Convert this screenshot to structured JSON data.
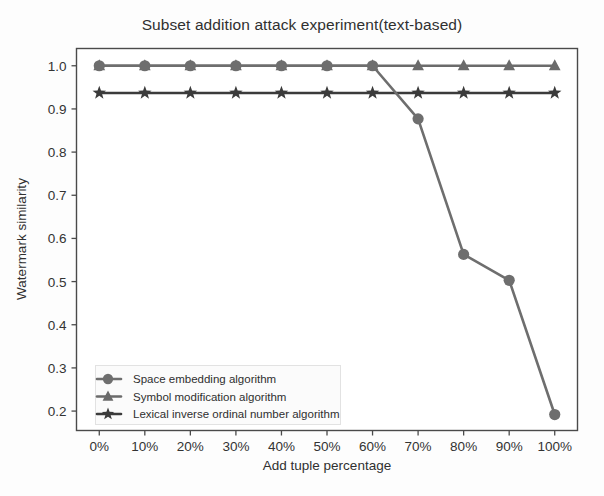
{
  "chart_data": {
    "type": "line",
    "title": "Subset addition attack experiment(text-based)",
    "xlabel": "Add tuple percentage",
    "ylabel": "Watermark similarity",
    "categories": [
      "0%",
      "10%",
      "20%",
      "30%",
      "40%",
      "50%",
      "60%",
      "70%",
      "80%",
      "90%",
      "100%"
    ],
    "x": [
      0,
      10,
      20,
      30,
      40,
      50,
      60,
      70,
      80,
      90,
      100
    ],
    "xtick_labels": [
      "0%",
      "10%",
      "20%",
      "30%",
      "40%",
      "50%",
      "60%",
      "70%",
      "80%",
      "90%",
      "100%"
    ],
    "ytick_labels": [
      "0.2",
      "0.3",
      "0.4",
      "0.5",
      "0.6",
      "0.7",
      "0.8",
      "0.9",
      "1.0"
    ],
    "yticks": [
      0.2,
      0.3,
      0.4,
      0.5,
      0.6,
      0.7,
      0.8,
      0.9,
      1.0
    ],
    "ylim": [
      0.155,
      1.04
    ],
    "xlim": [
      -5,
      105
    ],
    "grid": false,
    "legend_position": "lower left",
    "series": [
      {
        "name": "Space embedding algorithm",
        "marker": "circle",
        "color": "#6e6e6e",
        "values": [
          1.0,
          1.0,
          1.0,
          1.0,
          1.0,
          1.0,
          1.0,
          0.877,
          0.563,
          0.503,
          0.192
        ]
      },
      {
        "name": "Symbol modification algorithm",
        "marker": "triangle",
        "color": "#6b6b6b",
        "values": [
          1.0,
          1.0,
          1.0,
          1.0,
          1.0,
          1.0,
          1.0,
          1.0,
          1.0,
          1.0,
          1.0
        ]
      },
      {
        "name": "Lexical inverse ordinal number algorithm",
        "marker": "star",
        "color": "#3b3b3b",
        "values": [
          0.937,
          0.937,
          0.937,
          0.937,
          0.937,
          0.937,
          0.937,
          0.937,
          0.937,
          0.937,
          0.937
        ]
      }
    ]
  },
  "legend": {
    "items": [
      {
        "label": "Space embedding algorithm"
      },
      {
        "label": "Symbol modification algorithm"
      },
      {
        "label": "Lexical inverse ordinal number algorithm"
      }
    ]
  },
  "colors": {
    "frame": "#4a4a4a",
    "series_circle": "#6e6e6e",
    "series_triangle": "#6b6b6b",
    "series_star": "#3b3b3b",
    "background": "#fdfdfd",
    "text": "#303030"
  }
}
